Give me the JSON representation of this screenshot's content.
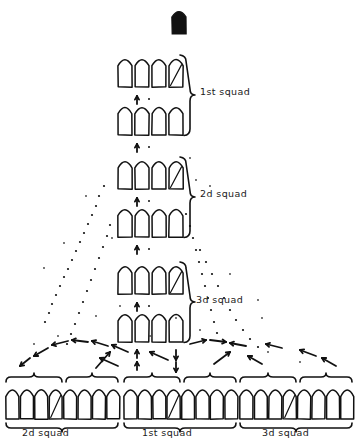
{
  "figure": {
    "title_visible": false,
    "ink_color": "#111111",
    "background_color": "#ffffff"
  },
  "leader": {
    "name": "platoon-leader",
    "symbol": "filled-soldier-marker",
    "filled": true,
    "x": 172,
    "y": 8,
    "w": 14,
    "h": 26
  },
  "column": {
    "label_side": "right",
    "file_count": 4,
    "rank_count": 6,
    "squads": [
      {
        "label": "1st squad",
        "label_x": 200,
        "label_y": 92,
        "brace": {
          "x": 184,
          "y_top": 55,
          "y_bottom": 135
        },
        "ranks": [
          {
            "y": 55,
            "figures": 4,
            "leader_index": 3
          },
          {
            "y": 103,
            "figures": 4,
            "leader_index": -1
          }
        ]
      },
      {
        "label": "2d squad",
        "label_x": 200,
        "label_y": 194,
        "brace": {
          "x": 184,
          "y_top": 157,
          "y_bottom": 237
        },
        "ranks": [
          {
            "y": 157,
            "figures": 4,
            "leader_index": 3
          },
          {
            "y": 205,
            "figures": 4,
            "leader_index": -1
          }
        ]
      },
      {
        "label": "3d squad",
        "label_x": 196,
        "label_y": 300,
        "brace": {
          "x": 184,
          "y_top": 262,
          "y_bottom": 342
        },
        "ranks": [
          {
            "y": 262,
            "figures": 4,
            "leader_index": 3
          },
          {
            "y": 310,
            "figures": 4,
            "leader_index": -1
          }
        ]
      }
    ]
  },
  "line": {
    "y": 385,
    "figure_width": 13,
    "figure_height": 34,
    "groups": [
      {
        "label": "2d squad",
        "label_x": 58,
        "label_y": 436,
        "start_x": 6,
        "figures": 8,
        "leader_index": 3
      },
      {
        "label": "1st squad",
        "label_x": 178,
        "label_y": 436,
        "start_x": 124,
        "figures": 8,
        "leader_index": 3
      },
      {
        "label": "3d squad",
        "label_x": 298,
        "label_y": 436,
        "start_x": 240,
        "figures": 8,
        "leader_index": 3
      }
    ],
    "top_braces": [
      {
        "x1": 6,
        "x2": 62
      },
      {
        "x1": 66,
        "x2": 118
      },
      {
        "x1": 124,
        "x2": 180
      },
      {
        "x1": 184,
        "x2": 236
      },
      {
        "x1": 240,
        "x2": 296
      },
      {
        "x1": 300,
        "x2": 352
      }
    ],
    "bottom_braces": [
      {
        "x1": 6,
        "x2": 118
      },
      {
        "x1": 124,
        "x2": 236
      },
      {
        "x1": 240,
        "x2": 352
      }
    ]
  },
  "movement": {
    "note": "dotted traces and arrows indicate squads deploying outward from column into line",
    "forward_arrow_count": 6,
    "left_flow_arrows": 9,
    "right_flow_arrows": 8
  }
}
